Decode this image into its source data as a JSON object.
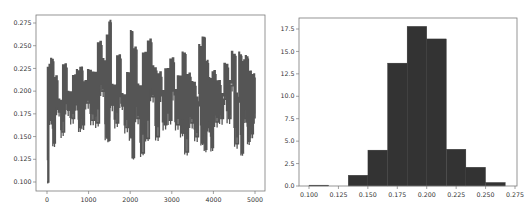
{
  "chart_data": [
    {
      "type": "line",
      "title": "",
      "xlabel": "",
      "ylabel": "",
      "xlim": [
        -250,
        5250
      ],
      "ylim": [
        0.091,
        0.283
      ],
      "grid": false,
      "xticks": [
        "0",
        "1000",
        "2000",
        "3000",
        "4000",
        "5000"
      ],
      "yticks": [
        "0.100",
        "0.125",
        "0.150",
        "0.175",
        "0.200",
        "0.225",
        "0.250",
        "0.275"
      ],
      "series": [
        {
          "name": "trace",
          "color": "#555555",
          "x": [
            0,
            40,
            80,
            120,
            160,
            200,
            260,
            320,
            360,
            420,
            480,
            540,
            600,
            660,
            700,
            740,
            780,
            820,
            860,
            900,
            960,
            1020,
            1080,
            1140,
            1200,
            1260,
            1320,
            1380,
            1420,
            1450,
            1480,
            1510,
            1540,
            1600,
            1660,
            1720,
            1780,
            1840,
            1900,
            1960,
            2000,
            2030,
            2060,
            2100,
            2160,
            2220,
            2280,
            2340,
            2400,
            2460,
            2520,
            2580,
            2640,
            2700,
            2760,
            2820,
            2880,
            2940,
            3000,
            3060,
            3120,
            3180,
            3240,
            3280,
            3340,
            3400,
            3460,
            3520,
            3580,
            3640,
            3680,
            3720,
            3760,
            3800,
            3840,
            3880,
            3920,
            3960,
            4000,
            4060,
            4120,
            4180,
            4240,
            4300,
            4360,
            4420,
            4480,
            4540,
            4600,
            4640,
            4680,
            4720,
            4760,
            4800,
            4840,
            4880,
            4920,
            4960,
            5000
          ],
          "y": [
            0.1,
            0.225,
            0.168,
            0.232,
            0.143,
            0.211,
            0.18,
            0.184,
            0.155,
            0.225,
            0.18,
            0.193,
            0.17,
            0.212,
            0.185,
            0.218,
            0.16,
            0.222,
            0.163,
            0.205,
            0.187,
            0.218,
            0.168,
            0.216,
            0.165,
            0.25,
            0.2,
            0.23,
            0.15,
            0.26,
            0.146,
            0.275,
            0.185,
            0.201,
            0.165,
            0.235,
            0.187,
            0.19,
            0.16,
            0.216,
            0.15,
            0.265,
            0.127,
            0.245,
            0.17,
            0.202,
            0.132,
            0.24,
            0.148,
            0.253,
            0.194,
            0.222,
            0.15,
            0.215,
            0.195,
            0.163,
            0.22,
            0.168,
            0.231,
            0.196,
            0.163,
            0.212,
            0.154,
            0.24,
            0.133,
            0.215,
            0.165,
            0.205,
            0.15,
            0.188,
            0.247,
            0.143,
            0.258,
            0.136,
            0.23,
            0.16,
            0.21,
            0.138,
            0.218,
            0.166,
            0.206,
            0.17,
            0.191,
            0.225,
            0.17,
            0.206,
            0.238,
            0.142,
            0.193,
            0.238,
            0.132,
            0.23,
            0.17,
            0.235,
            0.145,
            0.218,
            0.153,
            0.214,
            0.17
          ]
        }
      ]
    },
    {
      "type": "bar",
      "subtype": "histogram",
      "title": "",
      "xlabel": "",
      "ylabel": "",
      "xlim": [
        0.0917,
        0.2755
      ],
      "ylim": [
        0,
        18.7
      ],
      "grid": false,
      "xticks": [
        "0.100",
        "0.125",
        "0.150",
        "0.175",
        "0.200",
        "0.225",
        "0.250",
        "0.275"
      ],
      "yticks": [
        "0.0",
        "2.5",
        "5.0",
        "7.5",
        "10.0",
        "12.5",
        "15.0",
        "17.5"
      ],
      "bin_edges": [
        0.1,
        0.1167,
        0.1333,
        0.15,
        0.1667,
        0.1833,
        0.2,
        0.2167,
        0.2333,
        0.25,
        0.2667
      ],
      "values": [
        0.1,
        0.0,
        1.2,
        4.0,
        13.7,
        17.8,
        16.4,
        4.1,
        2.1,
        0.4
      ],
      "color": "#333333"
    }
  ],
  "colors": {
    "line": "#555555",
    "bars": "#333333",
    "axes": "#7a7a7a",
    "text": "#333333",
    "background": "#ffffff"
  }
}
